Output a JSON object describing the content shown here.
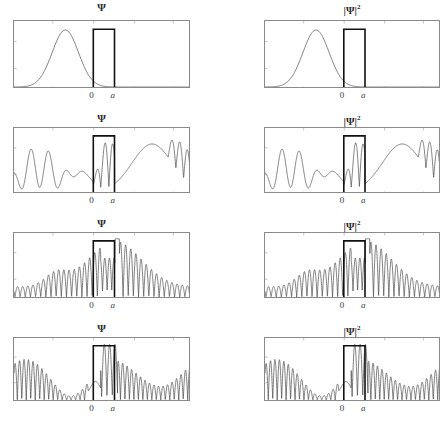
{
  "figure": {
    "title": "",
    "columns": [
      {
        "id": "psi",
        "label": "Ψ",
        "superscript": ""
      },
      {
        "id": "psi2",
        "label": "|Ψ|",
        "superscript": "2"
      }
    ],
    "axis_markers": {
      "origin": "0",
      "barrier_end": "a"
    },
    "colors": {
      "wave": "#4a4a4a",
      "barrier": "#111111",
      "frame": "#8a8a8a",
      "background": "#ffffff",
      "text": "#2b2b2b"
    }
  },
  "chart_data": {
    "type": "line",
    "xlabel": "",
    "ylabel": "",
    "xlim": [
      -10,
      10
    ],
    "ylim": [
      0,
      1
    ],
    "grid": false,
    "legend": null,
    "barrier": {
      "x_start": 0,
      "x_end": 1.6,
      "label_start": "0",
      "label_end": "a"
    },
    "panels": [
      {
        "row": 1,
        "column": "Ψ",
        "title": "Ψ",
        "description": "Incident Gaussian wave packet approaching barrier from the left; smooth single-humped envelope, zero amplitude inside and right of barrier.",
        "time_step": 1,
        "packet_center": -4.2,
        "packet_width": 2.1,
        "peak_height": 0.92,
        "oscillation_count": 0,
        "transmitted_amplitude": 0.0,
        "reflected_amplitude": 0.0
      },
      {
        "row": 1,
        "column": "|Ψ|²",
        "title": "|Ψ|",
        "title_superscript": "2",
        "description": "Probability density of the incident packet; same smooth single-humped profile.",
        "time_step": 1,
        "packet_center": -4.2,
        "packet_width": 2.1,
        "peak_height": 0.92,
        "oscillation_count": 0,
        "transmitted_amplitude": 0.0,
        "reflected_amplitude": 0.0
      },
      {
        "row": 2,
        "column": "Ψ",
        "title": "Ψ",
        "description": "Packet interacting with the barrier; strong interference fringes at far left, localized double peak inside barrier, broad transmitted hump to the right.",
        "time_step": 2,
        "packet_center": 0.0,
        "packet_width": 2.0,
        "peak_height": 0.85,
        "oscillation_count": 22,
        "transmitted_amplitude": 0.72,
        "reflected_amplitude": 0.8
      },
      {
        "row": 2,
        "column": "|Ψ|²",
        "title": "|Ψ|",
        "title_superscript": "2",
        "description": "Probability density during interaction; same fringe pattern with double peak inside barrier and transmitted hump at right.",
        "time_step": 2,
        "packet_center": 0.0,
        "packet_width": 2.0,
        "peak_height": 0.85,
        "oscillation_count": 22,
        "transmitted_amplitude": 0.72,
        "reflected_amplitude": 0.8
      },
      {
        "row": 3,
        "column": "Ψ",
        "title": "Ψ",
        "description": "Dense rapid oscillations across the whole domain with an envelope peaked just right of the barrier; spike at barrier edge.",
        "time_step": 3,
        "packet_center": 1.0,
        "packet_width": 4.0,
        "peak_height": 0.95,
        "oscillation_count": 46,
        "transmitted_amplitude": 0.9,
        "reflected_amplitude": 0.55
      },
      {
        "row": 3,
        "column": "|Ψ|²",
        "title": "|Ψ|",
        "title_superscript": "2",
        "description": "Probability density with dense oscillations, envelope peaked just right of the barrier.",
        "time_step": 3,
        "packet_center": 1.0,
        "packet_width": 4.0,
        "peak_height": 0.95,
        "oscillation_count": 46,
        "transmitted_amplitude": 0.9,
        "reflected_amplitude": 0.55
      },
      {
        "row": 4,
        "column": "Ψ",
        "title": "Ψ",
        "description": "Fully developed multi-lobed interference pattern filling the domain; tall narrow peak inside barrier, large modulated lobes both sides.",
        "time_step": 4,
        "packet_center": 2.0,
        "packet_width": 6.0,
        "peak_height": 0.97,
        "oscillation_count": 60,
        "transmitted_amplitude": 0.95,
        "reflected_amplitude": 0.88
      },
      {
        "row": 4,
        "column": "|Ψ|²",
        "title": "|Ψ|",
        "title_superscript": "2",
        "description": "Probability density of the fully developed interference pattern with multiple modulated lobes.",
        "time_step": 4,
        "packet_center": 2.0,
        "packet_width": 6.0,
        "peak_height": 0.97,
        "oscillation_count": 60,
        "transmitted_amplitude": 0.95,
        "reflected_amplitude": 0.88
      }
    ]
  }
}
